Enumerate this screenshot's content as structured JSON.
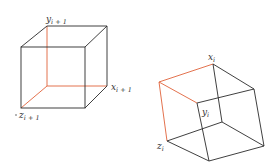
{
  "diagram": {
    "colors": {
      "edge": "#2a2a2a",
      "highlight": "#e0623a",
      "background": "#ffffff"
    },
    "cube_left": {
      "labels": {
        "y": {
          "base": "y",
          "sub": "i + 1"
        },
        "x": {
          "base": "x",
          "sub": "i + 1"
        },
        "z": {
          "base": "z",
          "sub": "i + 1"
        }
      }
    },
    "cube_right": {
      "labels": {
        "x": {
          "base": "x",
          "sub": "i"
        },
        "y": {
          "base": "y",
          "sub": "i"
        },
        "z": {
          "base": "z",
          "sub": "i"
        }
      }
    }
  }
}
